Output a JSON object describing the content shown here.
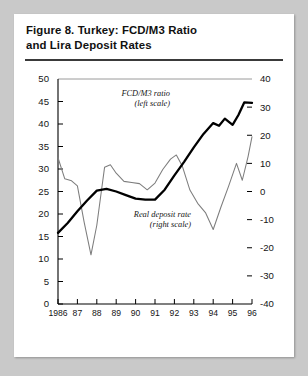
{
  "figure": {
    "title_line1": "Figure 8.  Turkey: FCD/M3 Ratio",
    "title_line2": "and Lira Deposit Rates"
  },
  "chart_data": {
    "type": "line",
    "title": "Figure 8.  Turkey: FCD/M3 Ratio and Lira Deposit Rates",
    "xlabel": "",
    "ylabel": "",
    "grid": false,
    "legend_position": "inline-annotations",
    "xlim": [
      1986,
      1996
    ],
    "x_tick_labels": [
      "1986",
      "87",
      "88",
      "89",
      "90",
      "91",
      "92",
      "93",
      "94",
      "95",
      "96"
    ],
    "left_axis": {
      "label": "FCD/M3 ratio (percent)",
      "ylim": [
        0,
        50
      ],
      "ticks": [
        0,
        5,
        10,
        15,
        20,
        25,
        30,
        35,
        40,
        45,
        50
      ],
      "tick_labels": [
        "0",
        "5",
        "10",
        "15",
        "20",
        "25",
        "30",
        "35",
        "40",
        "45",
        "50"
      ]
    },
    "right_axis": {
      "label": "Real deposit rate (percent)",
      "ylim": [
        -40,
        40
      ],
      "ticks": [
        -40,
        -30,
        -20,
        -10,
        0,
        10,
        20,
        30,
        40
      ],
      "tick_labels": [
        "-40",
        "-30",
        "-20",
        "-10",
        "0",
        "10",
        "20",
        "30",
        "40"
      ]
    },
    "annotations": [
      {
        "id": "fcd-m3-annotation",
        "line1": "FCD/M3 ratio",
        "line2": "(left scale)"
      },
      {
        "id": "real-deposit-annotation",
        "line1": "Real deposit rate",
        "line2": "(right scale)"
      }
    ],
    "series": [
      {
        "name": "FCD/M3 ratio",
        "axis": "left",
        "style": "thick-black",
        "x": [
          1986.0,
          1986.5,
          1987.0,
          1987.5,
          1988.0,
          1988.5,
          1989.0,
          1989.5,
          1990.0,
          1990.5,
          1991.0,
          1991.5,
          1992.0,
          1992.5,
          1993.0,
          1993.5,
          1994.0,
          1994.3,
          1994.6,
          1995.0,
          1995.3,
          1995.6,
          1996.0
        ],
        "values": [
          15.8,
          18.0,
          20.6,
          23.0,
          25.2,
          25.6,
          25.0,
          24.2,
          23.4,
          23.2,
          23.2,
          25.4,
          28.6,
          31.6,
          34.8,
          37.8,
          40.2,
          39.6,
          41.2,
          39.8,
          42.0,
          44.8,
          44.7
        ]
      },
      {
        "name": "Real deposit rate",
        "axis": "right",
        "style": "thin-gray",
        "x": [
          1986.0,
          1986.35,
          1986.7,
          1987.0,
          1987.35,
          1987.7,
          1988.0,
          1988.4,
          1988.7,
          1989.0,
          1989.4,
          1989.8,
          1990.2,
          1990.6,
          1991.0,
          1991.4,
          1991.8,
          1992.1,
          1992.4,
          1992.8,
          1993.2,
          1993.6,
          1994.0,
          1994.4,
          1994.8,
          1995.2,
          1995.5,
          1995.8,
          1996.0
        ],
        "values": [
          12.0,
          4.5,
          3.8,
          2.0,
          -11.0,
          -22.5,
          -12.0,
          8.6,
          9.5,
          6.5,
          3.6,
          3.2,
          2.8,
          0.6,
          3.0,
          7.8,
          11.5,
          13.0,
          9.2,
          0.5,
          -4.2,
          -7.5,
          -13.5,
          -5.5,
          2.0,
          10.0,
          4.0,
          12.5,
          19.5
        ]
      }
    ]
  }
}
